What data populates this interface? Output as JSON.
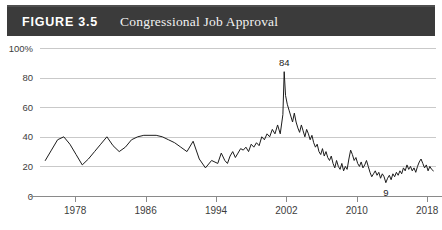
{
  "header": {
    "figure_number": "FIGURE 3.5",
    "title": "Congressional Job Approval",
    "band_color": "#3b3b3b",
    "text_color": "#ffffff"
  },
  "chart_data": {
    "type": "line",
    "title": "Congressional Job Approval",
    "xlabel": "",
    "ylabel": "",
    "grid": "horizontal",
    "legend": "none",
    "line_color": "#1c1c1c",
    "xlim": [
      1974,
      2019
    ],
    "ylim": [
      0,
      100
    ],
    "ytick_labels": [
      "0",
      "20",
      "40",
      "60",
      "80",
      "100%"
    ],
    "yticks": [
      0,
      20,
      40,
      60,
      80,
      100
    ],
    "xtick_labels": [
      "1978",
      "1986",
      "1994",
      "2002",
      "2010",
      "2018"
    ],
    "xticks": [
      1978,
      1986,
      1994,
      2002,
      2010,
      2018
    ],
    "annotations": [
      {
        "label": "84",
        "x": 2001.75,
        "y": 84,
        "position": "above"
      },
      {
        "label": "9",
        "x": 2013.3,
        "y": 9,
        "position": "below"
      }
    ],
    "series": [
      {
        "name": "Congressional Job Approval",
        "x": [
          1974.6,
          1975.3,
          1976.0,
          1976.7,
          1977.4,
          1978.1,
          1978.8,
          1979.5,
          1980.2,
          1980.9,
          1981.6,
          1982.3,
          1983.0,
          1983.7,
          1984.4,
          1985.1,
          1985.8,
          1986.5,
          1987.2,
          1987.9,
          1988.6,
          1989.3,
          1990.0,
          1990.7,
          1991.4,
          1992.1,
          1992.8,
          1993.5,
          1994.2,
          1994.6,
          1995.0,
          1995.3,
          1995.6,
          1995.9,
          1996.2,
          1996.5,
          1996.8,
          1997.1,
          1997.4,
          1997.7,
          1998.0,
          1998.3,
          1998.6,
          1998.9,
          1999.2,
          1999.5,
          1999.8,
          2000.1,
          2000.4,
          2000.7,
          2001.0,
          2001.3,
          2001.6,
          2001.75,
          2001.9,
          2002.1,
          2002.3,
          2002.5,
          2002.7,
          2002.9,
          2003.1,
          2003.3,
          2003.5,
          2003.7,
          2003.9,
          2004.1,
          2004.3,
          2004.5,
          2004.7,
          2004.9,
          2005.1,
          2005.3,
          2005.5,
          2005.7,
          2005.9,
          2006.1,
          2006.3,
          2006.5,
          2006.7,
          2006.9,
          2007.1,
          2007.3,
          2007.5,
          2007.7,
          2007.9,
          2008.1,
          2008.3,
          2008.5,
          2008.7,
          2008.9,
          2009.1,
          2009.3,
          2009.5,
          2009.7,
          2009.9,
          2010.1,
          2010.3,
          2010.5,
          2010.7,
          2010.9,
          2011.1,
          2011.3,
          2011.5,
          2011.7,
          2011.9,
          2012.1,
          2012.3,
          2012.5,
          2012.7,
          2012.9,
          2013.1,
          2013.3,
          2013.5,
          2013.7,
          2013.9,
          2014.1,
          2014.3,
          2014.5,
          2014.7,
          2014.9,
          2015.1,
          2015.3,
          2015.5,
          2015.7,
          2015.9,
          2016.1,
          2016.3,
          2016.5,
          2016.7,
          2016.9,
          2017.1,
          2017.3,
          2017.5,
          2017.7,
          2017.9,
          2018.1,
          2018.3,
          2018.5,
          2018.7
        ],
        "y": [
          24,
          31,
          38,
          40,
          35,
          28,
          21,
          25,
          30,
          35,
          40,
          34,
          30,
          33,
          38,
          40,
          41,
          41,
          41,
          40,
          38,
          36,
          33,
          30,
          37,
          25,
          19,
          24,
          22,
          29,
          24,
          22,
          27,
          30,
          26,
          29,
          32,
          31,
          33,
          30,
          35,
          33,
          36,
          34,
          40,
          38,
          42,
          40,
          45,
          42,
          48,
          42,
          55,
          84,
          68,
          62,
          58,
          54,
          50,
          56,
          50,
          46,
          43,
          48,
          44,
          40,
          45,
          42,
          38,
          41,
          36,
          33,
          35,
          30,
          28,
          32,
          27,
          30,
          26,
          24,
          27,
          22,
          19,
          24,
          20,
          18,
          22,
          17,
          20,
          18,
          25,
          31,
          28,
          24,
          26,
          22,
          20,
          23,
          19,
          21,
          24,
          20,
          16,
          13,
          15,
          17,
          14,
          16,
          12,
          15,
          13,
          9,
          12,
          14,
          11,
          15,
          13,
          16,
          14,
          17,
          15,
          19,
          17,
          21,
          18,
          20,
          17,
          19,
          16,
          20,
          23,
          25,
          22,
          19,
          21,
          17,
          20,
          18,
          17
        ]
      }
    ]
  }
}
